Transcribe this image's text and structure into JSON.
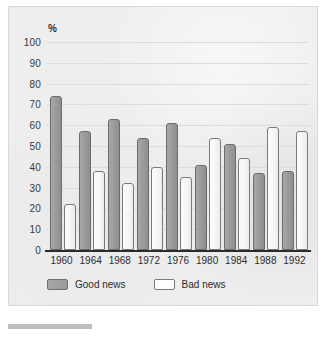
{
  "chart_data": {
    "type": "bar",
    "title": "",
    "xlabel": "",
    "ylabel": "%",
    "ylim": [
      0,
      100
    ],
    "yticks": [
      100,
      90,
      80,
      70,
      60,
      50,
      40,
      30,
      20,
      10,
      0
    ],
    "grid": true,
    "legend_position": "bottom-left",
    "categories": [
      "1960",
      "1964",
      "1968",
      "1972",
      "1976",
      "1980",
      "1984",
      "1988",
      "1992"
    ],
    "series": [
      {
        "name": "Good news",
        "color": "#9a9a9a",
        "values": [
          74,
          57,
          63,
          54,
          61,
          41,
          51,
          37,
          38
        ]
      },
      {
        "name": "Bad news",
        "color": "#fdfdfd",
        "values": [
          22,
          38,
          32,
          40,
          35,
          54,
          44,
          59,
          57
        ]
      }
    ]
  },
  "axis": {
    "percent_symbol": "%"
  },
  "legend": {
    "items": [
      {
        "label": "Good news",
        "swatch": "good"
      },
      {
        "label": "Bad news",
        "swatch": "bad"
      }
    ]
  }
}
